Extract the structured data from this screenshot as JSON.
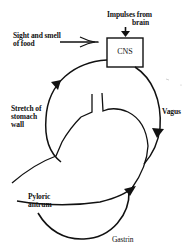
{
  "diagram": {
    "nodes": {
      "cns": {
        "label": "CNS"
      }
    },
    "labels": {
      "impulses_line1": "Impulses from",
      "impulses_line2": "brain",
      "sight_line1": "Sight and smell",
      "sight_line2": "of food",
      "stretch_line1": "Stretch of",
      "stretch_line2": "stomach",
      "stretch_line3": "wall",
      "vagus": "Vagus",
      "pyloric_line1": "Pyloric",
      "pyloric_line2": "antrum",
      "gastrin": "Gastrin"
    },
    "edges": [
      {
        "from": "Impulses from brain",
        "to": "CNS"
      },
      {
        "from": "Sight and smell of food",
        "to": "CNS"
      },
      {
        "from": "Stretch of stomach wall",
        "to": "CNS"
      },
      {
        "from": "CNS",
        "to": "Stomach",
        "label": "Vagus"
      },
      {
        "from": "Pyloric antrum",
        "to": "Stomach",
        "label": "Gastrin"
      }
    ],
    "colors": {
      "stroke": "#111111",
      "background": "#ffffff"
    }
  }
}
